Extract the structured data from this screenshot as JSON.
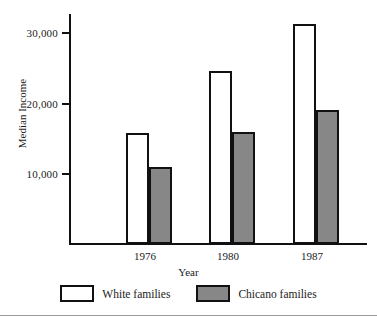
{
  "chart_data": {
    "type": "bar",
    "title": "",
    "xlabel": "Year",
    "ylabel": "Median Income",
    "categories": [
      "1976",
      "1980",
      "1987"
    ],
    "series": [
      {
        "name": "White families",
        "values": [
          15750,
          24500,
          31200
        ],
        "fill": "#ffffff"
      },
      {
        "name": "Chicano families",
        "values": [
          10900,
          15900,
          19000
        ],
        "fill": "#878787"
      }
    ],
    "ylim": [
      0,
      33000
    ],
    "yticks": [
      10000,
      20000,
      30000
    ],
    "ytick_labels": [
      "10,000",
      "20,000",
      "30,000"
    ],
    "grid": false,
    "legend_position": "bottom"
  },
  "axes": {
    "y_title": "Median Income",
    "x_title": "Year",
    "y_ticks": [
      {
        "label": "30,000",
        "value": 30000
      },
      {
        "label": "20,000",
        "value": 20000
      },
      {
        "label": "10,000",
        "value": 10000
      }
    ],
    "x_categories": [
      {
        "label": "1976"
      },
      {
        "label": "1980"
      },
      {
        "label": "1987"
      }
    ]
  },
  "legend": {
    "items": [
      {
        "label": "White families",
        "color": "#ffffff"
      },
      {
        "label": "Chicano families",
        "color": "#878787"
      }
    ]
  },
  "bars": [
    {
      "group": "1976",
      "series": "White families",
      "value": 15750
    },
    {
      "group": "1976",
      "series": "Chicano families",
      "value": 10900
    },
    {
      "group": "1980",
      "series": "White families",
      "value": 24500
    },
    {
      "group": "1980",
      "series": "Chicano families",
      "value": 15900
    },
    {
      "group": "1987",
      "series": "White families",
      "value": 31200
    },
    {
      "group": "1987",
      "series": "Chicano families",
      "value": 19000
    }
  ]
}
